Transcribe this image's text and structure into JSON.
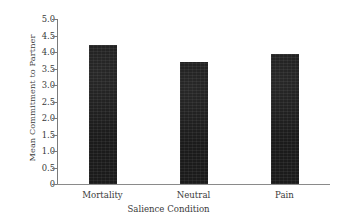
{
  "chart_data": {
    "type": "bar",
    "title": "",
    "subtitle": "",
    "xlabel": "Salience Condition",
    "ylabel": "Mean Commitment to Partner",
    "categories": [
      "Mortality",
      "Neutral",
      "Pain"
    ],
    "values": [
      4.2,
      3.7,
      3.95
    ],
    "series": [
      {
        "name": "Mean Commitment to Partner",
        "values": [
          4.2,
          3.7,
          3.95
        ]
      }
    ],
    "ylim": [
      0,
      5.0
    ],
    "ytick_values": [
      0,
      0.5,
      1.0,
      1.5,
      2.0,
      2.5,
      3.0,
      3.5,
      4.0,
      4.5,
      5.0
    ],
    "ytick_labels": [
      "0",
      "0.5",
      "1.0",
      "1.5",
      "2.0",
      "2.5",
      "3.0",
      "3.5",
      "4.0",
      "4.5",
      "5.0"
    ],
    "grid": false,
    "legend": false,
    "legend_position": "none",
    "bar_color": "#1b1b1b",
    "axis_color": "#7a7a7a",
    "background_color": "#ffffff",
    "annotations": []
  }
}
